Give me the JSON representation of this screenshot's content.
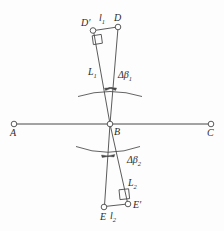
{
  "figure": {
    "background_color": "#fdfdfd",
    "stroke_color": "#404040",
    "label_color": "#2b2b2b"
  },
  "points": {
    "A": {
      "label": "A",
      "x": 14,
      "y": 124,
      "marker": "open-circle"
    },
    "B": {
      "label": "B",
      "x": 110,
      "y": 124,
      "marker": "open-circle"
    },
    "C": {
      "label": "C",
      "x": 211,
      "y": 124,
      "marker": "open-circle"
    },
    "D": {
      "label": "D",
      "x": 118,
      "y": 27,
      "marker": "open-circle"
    },
    "Dprime": {
      "label": "D′",
      "x": 93,
      "y": 30,
      "marker": "open-circle"
    },
    "E": {
      "label": "E",
      "x": 104,
      "y": 207,
      "marker": "open-circle"
    },
    "Eprime": {
      "label": "E′",
      "x": 128,
      "y": 204,
      "marker": "open-circle"
    }
  },
  "labels": {
    "A": "A",
    "B": "B",
    "C": "C",
    "D": "D",
    "D_prime": "D′",
    "E": "E",
    "E_prime": "E′",
    "l1_base": "l",
    "l1_sub": "1",
    "l2_base": "l",
    "l2_sub": "2",
    "L1_base": "L",
    "L1_sub": "1",
    "L2_base": "L",
    "L2_sub": "2",
    "delta_beta1_base": "Δβ",
    "delta_beta1_sub": "1",
    "delta_beta2_base": "Δβ",
    "delta_beta2_sub": "2"
  },
  "segments": {
    "baseline": {
      "from": "A",
      "to": "C",
      "description": "horizontal baseline through B"
    },
    "B_to_D": {
      "from": "B",
      "to": "D",
      "description": "upper right sight line"
    },
    "B_to_Dprime": {
      "from": "B",
      "to": "D′",
      "description": "upper left sight line"
    },
    "D_to_Dprime": {
      "from": "D",
      "to": "D′",
      "description": "upper offset segment l1"
    },
    "B_to_E": {
      "from": "B",
      "to": "E",
      "description": "lower left sight line"
    },
    "B_to_Eprime": {
      "from": "B",
      "to": "E′",
      "description": "lower right sight line"
    },
    "E_to_Eprime": {
      "from": "E",
      "to": "E′",
      "description": "lower offset segment l2"
    }
  },
  "markers": {
    "right_angle_upper": {
      "at": "D′",
      "type": "right-angle-square"
    },
    "right_angle_lower": {
      "at": "E′",
      "type": "right-angle-square"
    },
    "arc_upper": {
      "type": "double-arrow-arc",
      "measures": "Δβ₁"
    },
    "arc_lower": {
      "type": "double-arrow-arc",
      "measures": "Δβ₂"
    }
  }
}
